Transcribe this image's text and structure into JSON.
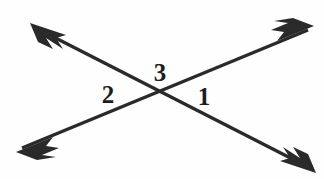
{
  "figure": {
    "background_color": "#fefefe",
    "stroke_color": "#2a2a2a",
    "label_color": "#1d1d1d",
    "width": 324,
    "height": 179,
    "intersection": {
      "x": 163,
      "y": 96
    },
    "lines": [
      {
        "name": "line-descending",
        "from": {
          "x": 36,
          "y": 28
        },
        "to": {
          "x": 310,
          "y": 168
        },
        "stroke_width": 3.4,
        "arrowheads": "both",
        "arrow_style": "barbed"
      },
      {
        "name": "line-ascending",
        "from": {
          "x": 22,
          "y": 148
        },
        "to": {
          "x": 308,
          "y": 30
        },
        "stroke_width": 3.4,
        "arrowheads": "both",
        "arrow_style": "barbed"
      }
    ],
    "labels": [
      {
        "text": "2",
        "x": 108,
        "y": 94,
        "position": "left-angle"
      },
      {
        "text": "3",
        "x": 160,
        "y": 72,
        "position": "top-angle"
      },
      {
        "text": "1",
        "x": 204,
        "y": 96,
        "position": "right-angle"
      }
    ]
  }
}
